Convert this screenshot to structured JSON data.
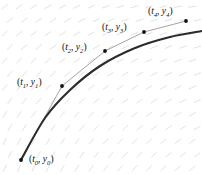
{
  "figure": {
    "background_color": "#ffffff",
    "slope_field": {
      "name": "slope-field",
      "color": "#e2e2e2",
      "dash_length": 7,
      "columns": 14,
      "rows": 13,
      "description": "short dashes whose inclination steepens toward lower-left"
    },
    "exact_curve": {
      "name": "exact-solution-curve",
      "color": "#2b2b2b",
      "width": 2.1
    },
    "euler_polyline": {
      "name": "euler-polyline",
      "color": "#9a9a9a",
      "width": 0.9
    },
    "point_color": "#111111",
    "point_radius": 1.9,
    "points": [
      {
        "id": "t0",
        "t": "t",
        "t_sub": "0",
        "y": "y",
        "y_sub": "0",
        "label": "(t0, y0)",
        "cx": 21,
        "cy": 160,
        "label_x": 29,
        "label_y": 155
      },
      {
        "id": "t1",
        "t": "t",
        "t_sub": "1",
        "y": "y",
        "y_sub": "1",
        "label": "(t1, y1)",
        "cx": 62,
        "cy": 86,
        "label_x": 17,
        "label_y": 78
      },
      {
        "id": "t2",
        "t": "t",
        "t_sub": "2",
        "y": "y",
        "y_sub": "2",
        "label": "(t2, y2)",
        "cx": 105,
        "cy": 51,
        "label_x": 62,
        "label_y": 43
      },
      {
        "id": "t3",
        "t": "t",
        "t_sub": "3",
        "y": "y",
        "y_sub": "3",
        "label": "(t3, y3)",
        "cx": 144,
        "cy": 32,
        "label_x": 102,
        "label_y": 23
      },
      {
        "id": "t4",
        "t": "t",
        "t_sub": "4",
        "y": "y",
        "y_sub": "4",
        "label": "(t4, y4)",
        "cx": 186,
        "cy": 21,
        "label_x": 148,
        "label_y": 7
      }
    ]
  },
  "chart_data": {
    "type": "line",
    "xlabel": "t",
    "ylabel": "y",
    "grid": false,
    "legend": "none",
    "series": [
      {
        "name": "Euler polyline",
        "points": [
          {
            "x": 21,
            "y": 160
          },
          {
            "x": 62,
            "y": 86
          },
          {
            "x": 105,
            "y": 51
          },
          {
            "x": 144,
            "y": 32
          },
          {
            "x": 186,
            "y": 21
          }
        ]
      },
      {
        "name": "Exact solution",
        "points": [
          {
            "x": 21,
            "y": 160
          },
          {
            "x": 45,
            "y": 118
          },
          {
            "x": 70,
            "y": 90
          },
          {
            "x": 100,
            "y": 66
          },
          {
            "x": 135,
            "y": 48
          },
          {
            "x": 170,
            "y": 37
          },
          {
            "x": 202,
            "y": 31
          }
        ]
      }
    ]
  }
}
